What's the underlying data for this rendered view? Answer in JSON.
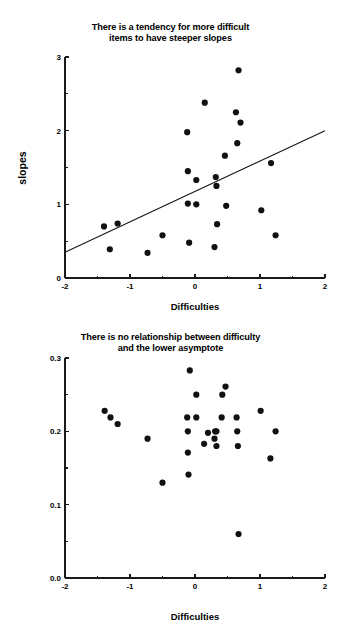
{
  "page": {
    "background_color": "#ffffff",
    "ink_color": "#111111"
  },
  "chart_data": [
    {
      "id": "slopes-vs-difficulties",
      "type": "scatter",
      "title": "There is a tendency for more difficult items to have steeper slopes",
      "title_line1": "There is a tendency for more difficult",
      "title_line2": "items to have steeper slopes",
      "xlabel": "Difficulties",
      "ylabel": "slopes",
      "xlim": [
        -2,
        2
      ],
      "ylim": [
        0,
        3
      ],
      "xticks": [
        -2,
        -1,
        0,
        1,
        2
      ],
      "xticklabels": [
        "-2",
        "-1",
        "0",
        "1",
        "2"
      ],
      "yticks": [
        0,
        1,
        2,
        3
      ],
      "yticklabels": [
        "0",
        "1",
        "2",
        "3"
      ],
      "x_minor_ticks": [
        -1.5,
        -0.5,
        0.5,
        1.5
      ],
      "y_minor_ticks": [
        0.5,
        1.5,
        2.5
      ],
      "grid": false,
      "legend": false,
      "marker": "filled-circle",
      "marker_size_px": 3.1,
      "points": [
        {
          "x": -1.4,
          "y": 0.7
        },
        {
          "x": -1.31,
          "y": 0.39
        },
        {
          "x": -1.19,
          "y": 0.74
        },
        {
          "x": -0.73,
          "y": 0.34
        },
        {
          "x": -0.5,
          "y": 0.58
        },
        {
          "x": -0.12,
          "y": 1.98
        },
        {
          "x": -0.11,
          "y": 1.45
        },
        {
          "x": -0.11,
          "y": 1.01
        },
        {
          "x": -0.09,
          "y": 0.48
        },
        {
          "x": 0.02,
          "y": 1.33
        },
        {
          "x": 0.02,
          "y": 1.0
        },
        {
          "x": 0.15,
          "y": 2.38
        },
        {
          "x": 0.3,
          "y": 0.42
        },
        {
          "x": 0.32,
          "y": 1.37
        },
        {
          "x": 0.33,
          "y": 1.25
        },
        {
          "x": 0.34,
          "y": 0.73
        },
        {
          "x": 0.46,
          "y": 1.66
        },
        {
          "x": 0.48,
          "y": 0.98
        },
        {
          "x": 0.63,
          "y": 2.25
        },
        {
          "x": 0.65,
          "y": 1.83
        },
        {
          "x": 0.67,
          "y": 2.82
        },
        {
          "x": 0.7,
          "y": 2.11
        },
        {
          "x": 1.02,
          "y": 0.92
        },
        {
          "x": 1.17,
          "y": 1.56
        },
        {
          "x": 1.24,
          "y": 0.58
        }
      ],
      "fit_line": {
        "visible": true,
        "x_start": -2,
        "y_start": 0.35,
        "x_end": 2,
        "y_end": 2.0
      }
    },
    {
      "id": "lower-asymptotes-vs-difficulties",
      "type": "scatter",
      "title": "There is no relationship between difficulty and the lower asymptote",
      "title_line1": "There is no relationship between difficulty",
      "title_line2": "and the lower asymptote",
      "xlabel": "Difficulties",
      "ylabel": "Lower Asymptotes",
      "xlim": [
        -2,
        2
      ],
      "ylim": [
        0.0,
        0.3
      ],
      "xticks": [
        -2,
        -1,
        0,
        1,
        2
      ],
      "xticklabels": [
        "-2",
        "-1",
        "0",
        "1",
        "2"
      ],
      "yticks": [
        0.0,
        0.1,
        0.2,
        0.3
      ],
      "yticklabels": [
        "0.0",
        "0.1",
        "0.2",
        "0.3"
      ],
      "x_minor_ticks": [
        -1.5,
        -0.5,
        0.5,
        1.5
      ],
      "y_minor_ticks": [
        0.05,
        0.15,
        0.25
      ],
      "grid": false,
      "legend": false,
      "marker": "filled-circle",
      "marker_size_px": 3.1,
      "points": [
        {
          "x": -1.39,
          "y": 0.228
        },
        {
          "x": -1.3,
          "y": 0.219
        },
        {
          "x": -1.19,
          "y": 0.21
        },
        {
          "x": -0.73,
          "y": 0.19
        },
        {
          "x": -0.5,
          "y": 0.13
        },
        {
          "x": -0.12,
          "y": 0.219
        },
        {
          "x": -0.11,
          "y": 0.2
        },
        {
          "x": -0.11,
          "y": 0.171
        },
        {
          "x": -0.1,
          "y": 0.141
        },
        {
          "x": -0.08,
          "y": 0.283
        },
        {
          "x": 0.02,
          "y": 0.219
        },
        {
          "x": 0.02,
          "y": 0.25
        },
        {
          "x": 0.14,
          "y": 0.183
        },
        {
          "x": 0.2,
          "y": 0.198
        },
        {
          "x": 0.3,
          "y": 0.19
        },
        {
          "x": 0.31,
          "y": 0.2
        },
        {
          "x": 0.33,
          "y": 0.2
        },
        {
          "x": 0.33,
          "y": 0.18
        },
        {
          "x": 0.41,
          "y": 0.219
        },
        {
          "x": 0.42,
          "y": 0.25
        },
        {
          "x": 0.47,
          "y": 0.261
        },
        {
          "x": 0.64,
          "y": 0.219
        },
        {
          "x": 0.65,
          "y": 0.2
        },
        {
          "x": 0.66,
          "y": 0.18
        },
        {
          "x": 0.67,
          "y": 0.06
        },
        {
          "x": 1.01,
          "y": 0.228
        },
        {
          "x": 1.16,
          "y": 0.163
        },
        {
          "x": 1.24,
          "y": 0.2
        }
      ],
      "fit_line": {
        "visible": false
      }
    }
  ]
}
